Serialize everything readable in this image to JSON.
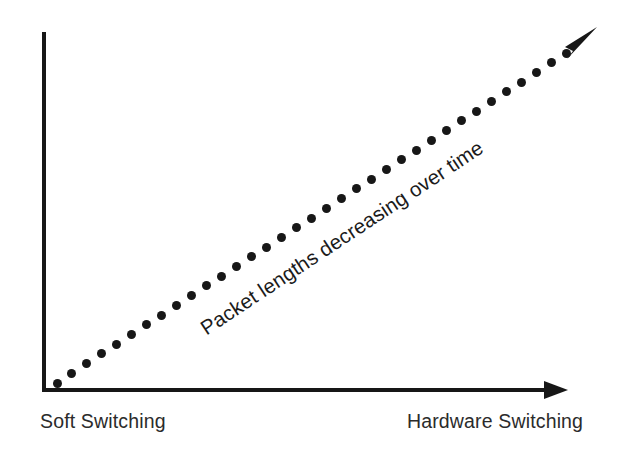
{
  "diagram": {
    "background_color": "#ffffff",
    "ink_color": "#171717",
    "axes": {
      "y_axis_name": "vertical-axis",
      "x_axis_name": "horizontal-axis",
      "x_axis_has_arrowhead": true,
      "y_axis_has_arrowhead": false,
      "origin_x": 44,
      "origin_y": 390
    },
    "trend": {
      "annotation": "Packet lengths decreasing over time",
      "annotation_rotation_deg": -33.5,
      "marker_style": "dotted",
      "marker_count": 35,
      "marker_diameter_px": 9,
      "arrowhead": "filled-triangle",
      "start_x": 57,
      "start_y": 383,
      "end_x": 566,
      "end_y": 53
    },
    "labels": {
      "left": "Soft Switching",
      "right": "Hardware Switching"
    }
  },
  "chart_data": {
    "type": "line",
    "title": "",
    "xlabel": "",
    "ylabel": "",
    "grid": false,
    "legend": null,
    "annotations": [
      {
        "text": "Packet lengths decreasing over time",
        "placement": "along-trend-line",
        "rotation_deg": -33.5
      }
    ],
    "x_axis": {
      "type": "categorical-continuum",
      "tick_labels": [
        "Soft Switching",
        "Hardware Switching"
      ],
      "arrow": true
    },
    "y_axis": {
      "type": "unlabeled",
      "tick_labels": [],
      "arrow": false
    },
    "series": [
      {
        "name": "Packet length trend",
        "style": "dotted-with-arrowhead",
        "color": "#171717",
        "x": [
          0,
          1
        ],
        "values": [
          0,
          1
        ],
        "direction": "increasing"
      }
    ]
  }
}
